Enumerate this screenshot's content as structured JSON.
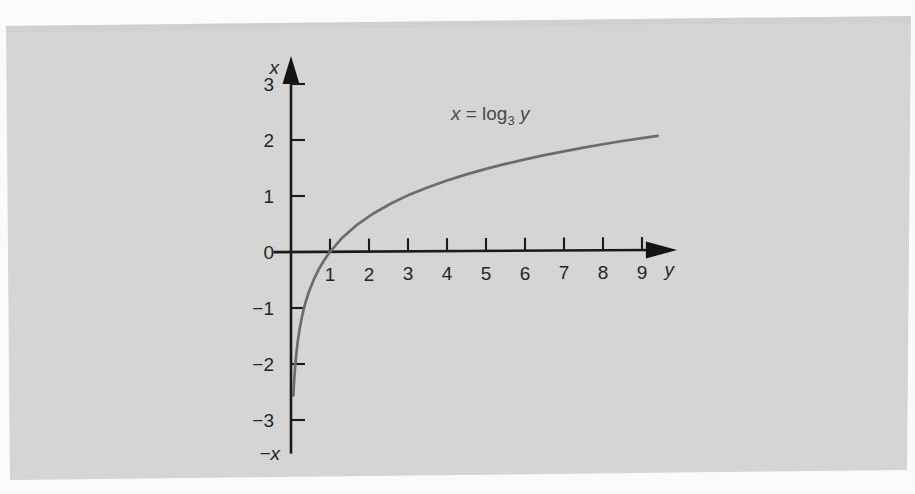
{
  "figure": {
    "background_color": "#ffffff",
    "page_color": "#d9d9d9",
    "curve_color": "#6e6e6e",
    "axis_color": "#1b1b1b",
    "text_color": "#262626",
    "equation_label": "x = log3 y",
    "equation_parts": {
      "lhs": "x",
      "equals": "=",
      "func": "log",
      "base": "3",
      "arg": "y"
    },
    "vertical_axis_label": "x",
    "vertical_axis_negative_label": "−x",
    "horizontal_axis_label": "y"
  },
  "chart_data": {
    "type": "line",
    "title": "",
    "xlabel": "y",
    "ylabel": "x",
    "grid": false,
    "legend": "none",
    "annotations": [
      {
        "text": "x = log3 y",
        "x": 4.1,
        "y": 2.35
      }
    ],
    "xlim": [
      -0.45,
      9.9
    ],
    "ylim": [
      -3.6,
      3.5
    ],
    "xticks": [
      1,
      2,
      3,
      4,
      5,
      6,
      7,
      8,
      9
    ],
    "xtick_labels": [
      "1",
      "2",
      "3",
      "4",
      "5",
      "6",
      "7",
      "8",
      "9"
    ],
    "yticks": [
      -3,
      -2,
      -1,
      0,
      1,
      2,
      3
    ],
    "ytick_labels": [
      "−3",
      "−2",
      "−1",
      "0",
      "1",
      "2",
      "3"
    ],
    "series": [
      {
        "name": "x = log3 y",
        "color": "#6e6e6e",
        "x": [
          0.06,
          0.08,
          0.1,
          0.13,
          0.17,
          0.22,
          0.28,
          0.36,
          0.46,
          0.58,
          0.72,
          0.85,
          1.0,
          1.3,
          1.7,
          2.1,
          2.6,
          3.0,
          3.5,
          4.0,
          4.5,
          5.0,
          5.5,
          6.0,
          6.5,
          7.0,
          7.5,
          8.0,
          8.5,
          9.0,
          9.4
        ],
        "y": [
          -2.56,
          -2.3,
          -2.1,
          -1.86,
          -1.61,
          -1.38,
          -1.16,
          -0.93,
          -0.71,
          -0.5,
          -0.3,
          -0.15,
          0.0,
          0.239,
          0.483,
          0.675,
          0.87,
          1.0,
          1.14,
          1.262,
          1.369,
          1.465,
          1.552,
          1.631,
          1.704,
          1.771,
          1.834,
          1.893,
          1.949,
          2.0,
          2.037
        ]
      }
    ]
  }
}
